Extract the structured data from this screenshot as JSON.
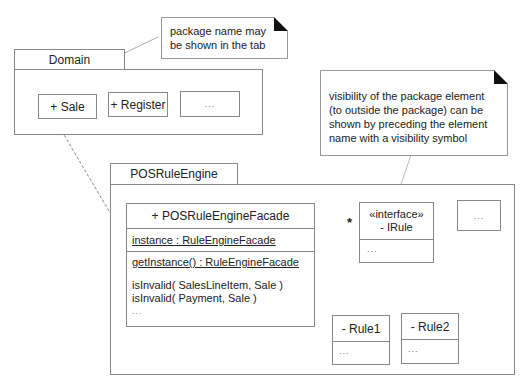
{
  "notes": {
    "tab_note": "package name may be shown in the tab",
    "visibility_note": "visibility of the package element (to outside the package) can be shown by preceding the element name with a visibility symbol"
  },
  "domain_package": {
    "name": "Domain",
    "elements": [
      "+ Sale",
      "+ Register",
      "..."
    ]
  },
  "rule_engine_package": {
    "name": "POSRuleEngine",
    "facade": {
      "name": "+ POSRuleEngineFacade",
      "attribute": "instance : RuleEngineFacade",
      "static_operation": "getInstance() : RuleEngineFacade",
      "operations": [
        "isInvalid( SalesLineItem, Sale )",
        "isInvalid( Payment, Sale )",
        "..."
      ]
    },
    "interface": {
      "stereotype": "«interface»",
      "name": "- IRule",
      "body": "..."
    },
    "other_element": "...",
    "implementations": [
      {
        "name": "- Rule1",
        "body": "..."
      },
      {
        "name": "- Rule2",
        "body": "..."
      }
    ],
    "multiplicity": "*"
  }
}
